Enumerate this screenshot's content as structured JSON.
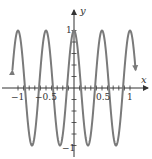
{
  "chart_data": {
    "type": "line",
    "title": "",
    "function": "y = cos(4πx)",
    "xlabel": "x",
    "ylabel": "y",
    "xlim": [
      -1.1,
      1.1
    ],
    "ylim": [
      -1,
      1
    ],
    "grid": false,
    "legend": null,
    "x_ticks": [
      -1,
      -0.9,
      -0.8,
      -0.7,
      -0.6,
      -0.5,
      -0.4,
      -0.3,
      -0.2,
      -0.1,
      0.1,
      0.2,
      0.3,
      0.4,
      0.5,
      0.6,
      0.7,
      0.8,
      0.9,
      1
    ],
    "x_tick_labels": [
      {
        "value": -1,
        "label": "−1"
      },
      {
        "value": -0.5,
        "label": "−0.5"
      },
      {
        "value": 0.5,
        "label": "0.5"
      },
      {
        "value": 1,
        "label": "1"
      }
    ],
    "y_ticks": [
      -1,
      -0.8,
      -0.6,
      -0.4,
      -0.2,
      0.2,
      0.4,
      0.6,
      0.8,
      1
    ],
    "y_tick_labels": [
      {
        "value": 1,
        "label": "1"
      },
      {
        "value": -1,
        "label": "−1"
      }
    ],
    "series": [
      {
        "name": "cos(4πx)",
        "color": "#7a7a7a",
        "x": [
          -1.1,
          -1.0,
          -0.875,
          -0.75,
          -0.625,
          -0.5,
          -0.375,
          -0.25,
          -0.125,
          0,
          0.125,
          0.25,
          0.375,
          0.5,
          0.625,
          0.75,
          0.875,
          1.0,
          1.1
        ],
        "values": [
          0.31,
          1,
          0,
          -1,
          0,
          1,
          0,
          -1,
          0,
          1,
          0,
          -1,
          0,
          1,
          0,
          -1,
          0,
          1,
          0.31
        ],
        "end_arrows": true
      }
    ]
  },
  "labels": {
    "x_axis": "x",
    "y_axis": "y",
    "tick_neg1": "−1",
    "tick_neg05": "−0.5",
    "tick_05": "0.5",
    "tick_1": "1",
    "ytick_1": "1",
    "ytick_neg1": "−1"
  },
  "colors": {
    "curve": "#7a7a7a",
    "axis": "#333333"
  }
}
